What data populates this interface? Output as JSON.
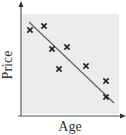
{
  "chart_data": {
    "type": "scatter",
    "title": "",
    "xlabel": "Age",
    "ylabel": "Price",
    "xlim": [
      0,
      10
    ],
    "ylim": [
      0,
      10
    ],
    "grid": false,
    "legend": null,
    "ticks": "none",
    "series": [
      {
        "name": "observations",
        "marker": "x",
        "x": [
          0.9,
          2.3,
          3.1,
          4.6,
          3.8,
          6.5,
          8.5,
          8.5
        ],
        "y": [
          8.6,
          9.0,
          6.7,
          6.9,
          4.7,
          5.0,
          3.5,
          1.9
        ]
      }
    ],
    "trend_line": {
      "name": "line of best fit",
      "x": [
        0.8,
        9.3
      ],
      "y": [
        9.4,
        1.3
      ]
    }
  },
  "colors": {
    "plot_background": "#ececec",
    "axis": "#555555",
    "marker": "#222222",
    "trend_line": "#666666",
    "label": "#333333"
  }
}
